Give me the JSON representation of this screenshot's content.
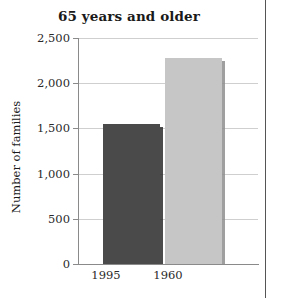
{
  "chart_data": {
    "type": "bar",
    "title": "65 years and older",
    "xlabel": "",
    "ylabel": "Number of families",
    "categories": [
      "1995",
      "1960"
    ],
    "values": [
      1550,
      2280
    ],
    "series": [
      {
        "name": "Number of families",
        "values": [
          1550,
          2280
        ]
      }
    ],
    "ylim": [
      0,
      2500
    ],
    "yticks": [
      0,
      500,
      1000,
      1500,
      2000,
      2500
    ],
    "ytick_labels": [
      "0",
      "500",
      "1,000",
      "1,500",
      "2,000",
      "2,500"
    ],
    "grid": true,
    "legend": false,
    "bar_colors": [
      "#4a4a4a",
      "#c6c6c6"
    ]
  },
  "chart": {
    "title": "65 years and older",
    "ylabel": "Number of families",
    "ytick_labels": [
      "2,500",
      "2,000",
      "1,500",
      "1,000",
      "500",
      "0"
    ],
    "xtick_labels": [
      "1995",
      "1960"
    ],
    "bars": [
      {
        "label": "1995",
        "value": 1550,
        "color": "#4a4a4a"
      },
      {
        "label": "1960",
        "value": 2280,
        "color": "#c6c6c6"
      }
    ],
    "colors": {
      "grid": "#cfcfcf",
      "axis": "#8a8a8a",
      "text": "#1a1a1a",
      "page_rule": "#555555"
    }
  }
}
